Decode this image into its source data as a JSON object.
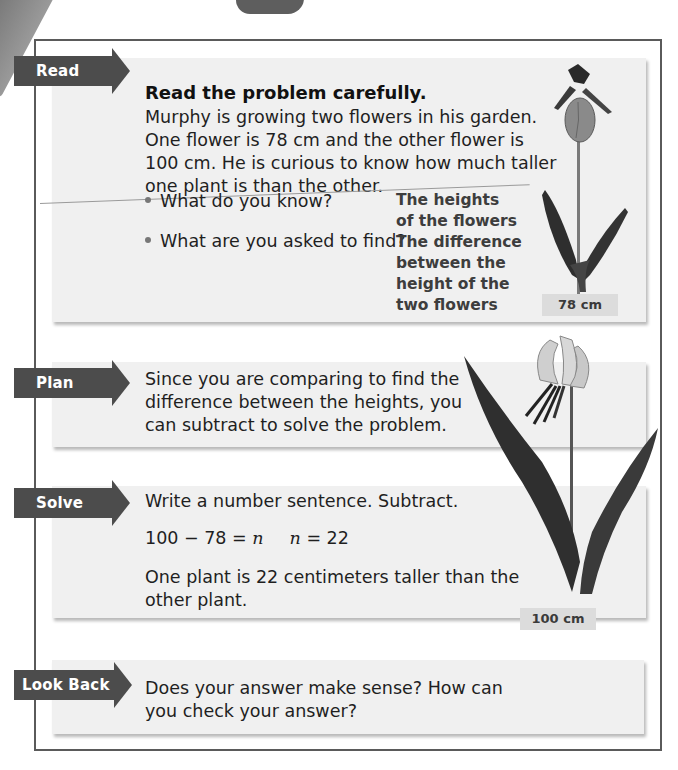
{
  "steps": {
    "read": {
      "label": "Read",
      "heading": "Read the problem carefully.",
      "body_lines": [
        "Murphy is growing two flowers in his garden.",
        "One flower is 78 cm and the other flower is",
        "100 cm. He is curious to know how much taller",
        "one plant is than the other."
      ],
      "questions": [
        {
          "q": "What do you know?",
          "a_lines": [
            "The heights",
            "of the flowers"
          ]
        },
        {
          "q": "What are you asked to find?",
          "a_lines": [
            "The difference",
            "between the",
            "height of the",
            "two flowers"
          ]
        }
      ]
    },
    "plan": {
      "label": "Plan",
      "body_lines": [
        "Since you are comparing to find the",
        "difference between the heights, you",
        "can subtract to solve the problem."
      ]
    },
    "solve": {
      "label": "Solve",
      "instruction": "Write a number sentence. Subtract.",
      "equation": {
        "lhs": "100 − 78 = ",
        "var1": "n",
        "var2": "n",
        "rhs": " = 22"
      },
      "answer_lines": [
        "One plant is 22 centimeters taller than the",
        "other plant."
      ]
    },
    "look_back": {
      "label": "Look Back",
      "body_lines": [
        "Does your answer make sense?  How can",
        "you check your answer?"
      ]
    }
  },
  "flowers": {
    "small": {
      "height_label": "78 cm"
    },
    "tall": {
      "height_label": "100 cm"
    }
  },
  "colors": {
    "arrow": "#4c4c4c",
    "panel": "#f0f0f0",
    "frame": "#5a5a5a",
    "label_bg": "#dcdcdc"
  }
}
